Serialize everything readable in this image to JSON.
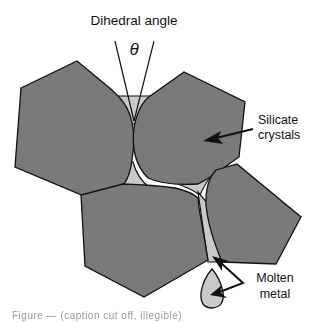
{
  "diagram": {
    "title_label": "Dihedral angle",
    "angle_symbol": "θ",
    "labels": {
      "silicate_line1": "Silicate",
      "silicate_line2": "crystals",
      "molten_line1": "Molten",
      "molten_line2": "metal"
    },
    "colors": {
      "crystal_fill": "#7a7a7a",
      "melt_fill": "#c9c9c9",
      "outline": "#111111",
      "background": "#ffffff"
    },
    "elements": [
      {
        "type": "crystal",
        "name": "upper-left-crystal"
      },
      {
        "type": "crystal",
        "name": "upper-right-crystal"
      },
      {
        "type": "crystal",
        "name": "lower-center-crystal"
      },
      {
        "type": "crystal",
        "name": "lower-right-crystal"
      },
      {
        "type": "melt",
        "name": "top-triple-junction-melt"
      },
      {
        "type": "melt",
        "name": "center-junction-melt"
      },
      {
        "type": "melt",
        "name": "right-junction-melt"
      },
      {
        "type": "melt",
        "name": "lower-edge-melt"
      },
      {
        "type": "melt",
        "name": "isolated-metal-droplet"
      }
    ]
  },
  "caption": {
    "text": "Figure — (caption cut off, illegible)"
  }
}
